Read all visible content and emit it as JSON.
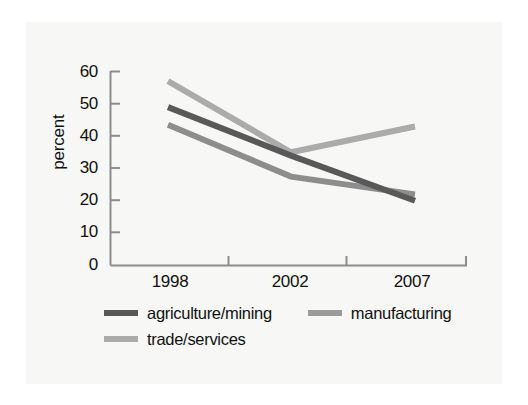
{
  "chart_data": {
    "type": "line",
    "title": "",
    "xlabel": "",
    "ylabel": "percent",
    "categories": [
      "1998",
      "2002",
      "2007"
    ],
    "ylim": [
      0,
      60
    ],
    "yticks": [
      0,
      10,
      20,
      30,
      40,
      50,
      60
    ],
    "ytick_labels": [
      "0",
      "10",
      "20",
      "30",
      "40",
      "50",
      "60"
    ],
    "grid": false,
    "legend_position": "below-plot",
    "series": [
      {
        "name": "agriculture/mining",
        "color": "#595959",
        "values": [
          49,
          34,
          20
        ]
      },
      {
        "name": "manufacturing",
        "color": "#8d8d8d",
        "values": [
          43.5,
          27.5,
          22
        ]
      },
      {
        "name": "trade/services",
        "color": "#ababab",
        "values": [
          57,
          35,
          43
        ]
      }
    ]
  },
  "axes": {
    "y_title": "percent",
    "y_labels": [
      "60",
      "50",
      "40",
      "30",
      "20",
      "10",
      "0"
    ],
    "x_labels": [
      "1998",
      "2002",
      "2007"
    ],
    "axis_color": "#8c8c8c"
  },
  "legend": {
    "rows": [
      [
        {
          "label": "agriculture/mining",
          "color": "#595959"
        },
        {
          "label": "manufacturing",
          "color": "#9b9b9b"
        }
      ],
      [
        {
          "label": "trade/services",
          "color": "#ababab"
        }
      ]
    ]
  }
}
